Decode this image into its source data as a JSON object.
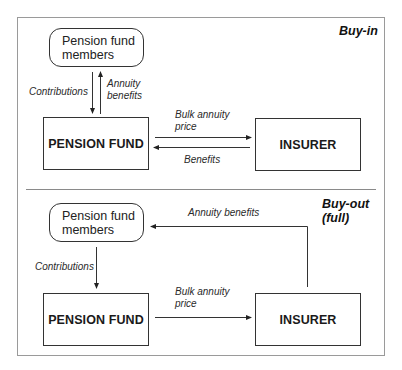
{
  "diagram": {
    "sections": [
      {
        "id": "buy-in",
        "title": "Buy-in",
        "members_box": {
          "line1": "Pension fund",
          "line2": "members"
        },
        "pension_fund_box": "PENSION FUND",
        "insurer_box": "INSURER",
        "flows": {
          "contributions": "Contributions",
          "annuity_benefits_line1": "Annuity",
          "annuity_benefits_line2": "benefits",
          "bulk_annuity_price_line1": "Bulk  annuity",
          "bulk_annuity_price_line2": "price",
          "benefits": "Benefits"
        }
      },
      {
        "id": "buy-out",
        "title_line1": "Buy-out",
        "title_line2": "(full)",
        "members_box": {
          "line1": "Pension fund",
          "line2": "members"
        },
        "pension_fund_box": "PENSION FUND",
        "insurer_box": "INSURER",
        "flows": {
          "contributions": "Contributions",
          "annuity_benefits": "Annuity benefits",
          "bulk_annuity_price_line1": "Bulk  annuity",
          "bulk_annuity_price_line2": "price"
        }
      }
    ],
    "colors": {
      "line": "#333333",
      "frame": "#9a9a9a",
      "text": "#1a1a1a"
    }
  }
}
